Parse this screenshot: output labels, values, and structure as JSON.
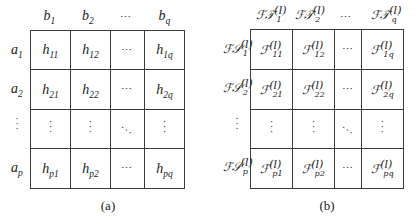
{
  "panel_a": {
    "caption": "(a)",
    "column_headers": [
      {
        "base": "b",
        "sub": "1"
      },
      {
        "base": "b",
        "sub": "2"
      },
      {
        "base": "⋯",
        "sub": ""
      },
      {
        "base": "b",
        "sub": "q"
      }
    ],
    "row_headers": [
      {
        "base": "a",
        "sub": "1"
      },
      {
        "base": "a",
        "sub": "2"
      },
      {
        "base": "⋮",
        "sub": ""
      },
      {
        "base": "a",
        "sub": "p"
      }
    ],
    "rows": [
      [
        {
          "base": "h",
          "sub": "11"
        },
        {
          "base": "h",
          "sub": "12"
        },
        {
          "base": "⋯",
          "sub": ""
        },
        {
          "base": "h",
          "sub": "1q"
        }
      ],
      [
        {
          "base": "h",
          "sub": "21"
        },
        {
          "base": "h",
          "sub": "22"
        },
        {
          "base": "⋯",
          "sub": ""
        },
        {
          "base": "h",
          "sub": "2q"
        }
      ],
      [
        {
          "base": "⋮",
          "sub": ""
        },
        {
          "base": "⋮",
          "sub": ""
        },
        {
          "base": "⋱",
          "sub": ""
        },
        {
          "base": "⋮",
          "sub": ""
        }
      ],
      [
        {
          "base": "h",
          "sub": "p1"
        },
        {
          "base": "h",
          "sub": "p2"
        },
        {
          "base": "⋯",
          "sub": ""
        },
        {
          "base": "h",
          "sub": "pq"
        }
      ]
    ]
  },
  "panel_b": {
    "caption": "(b)",
    "superscript": "(l)",
    "column_headers": [
      {
        "base": "ℱ𝒯",
        "sub": "1"
      },
      {
        "base": "ℱ𝒯",
        "sub": "2"
      },
      {
        "base": "⋯",
        "sub": ""
      },
      {
        "base": "ℱ𝒯",
        "sub": "q"
      }
    ],
    "row_headers": [
      {
        "base": "ℱ𝒮",
        "sub": "1"
      },
      {
        "base": "ℱ𝒮",
        "sub": "2"
      },
      {
        "base": "⋮",
        "sub": ""
      },
      {
        "base": "ℱ𝒮",
        "sub": "p"
      }
    ],
    "rows": [
      [
        {
          "base": "ℱ",
          "sub": "11"
        },
        {
          "base": "ℱ",
          "sub": "12"
        },
        {
          "base": "⋯",
          "sub": ""
        },
        {
          "base": "ℱ",
          "sub": "1q"
        }
      ],
      [
        {
          "base": "ℱ",
          "sub": "21"
        },
        {
          "base": "ℱ",
          "sub": "22"
        },
        {
          "base": "⋯",
          "sub": ""
        },
        {
          "base": "ℱ",
          "sub": "2q"
        }
      ],
      [
        {
          "base": "⋮",
          "sub": ""
        },
        {
          "base": "⋮",
          "sub": ""
        },
        {
          "base": "⋱",
          "sub": ""
        },
        {
          "base": "⋮",
          "sub": ""
        }
      ],
      [
        {
          "base": "ℱ",
          "sub": "p1"
        },
        {
          "base": "ℱ",
          "sub": "p2"
        },
        {
          "base": "⋯",
          "sub": ""
        },
        {
          "base": "ℱ",
          "sub": "pq"
        }
      ]
    ]
  }
}
